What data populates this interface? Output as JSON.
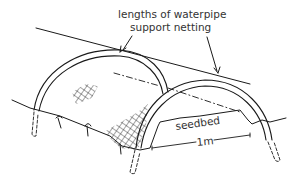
{
  "diagram": {
    "labels": {
      "top_line1": "lengths of waterpipe",
      "top_line2": "support netting",
      "seedbed": "seedbed",
      "width": "1m"
    },
    "colors": {
      "ink": "#1a1a1a",
      "text": "#333333",
      "background": "#ffffff"
    }
  }
}
